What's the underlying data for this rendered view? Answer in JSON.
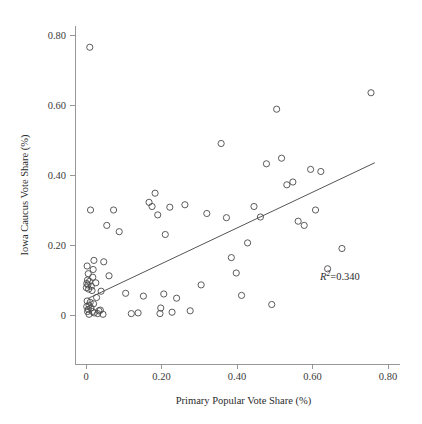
{
  "chart_data": {
    "type": "scatter",
    "title": "",
    "xlabel": "Primary Popular Vote Share (%)",
    "ylabel": "Iowa Caucus Vote Share (%)",
    "xlim": [
      -0.035,
      0.84
    ],
    "ylim": [
      -0.025,
      0.825
    ],
    "grid": false,
    "legend": null,
    "xticks": [
      0,
      0.2,
      0.4,
      0.6,
      0.8
    ],
    "xticklabels": [
      "0",
      "0.20",
      "0.40",
      "0.60",
      "0.80"
    ],
    "yticks": [
      0,
      0.2,
      0.4,
      0.6,
      0.8
    ],
    "yticklabels": [
      "0",
      "0.20",
      "0.40",
      "0.60",
      "0.80"
    ],
    "marker": "open-circle",
    "marker_color": "#4a4a4a",
    "annotations": [
      {
        "name": "r-squared",
        "prefix": "R",
        "superscript": "2",
        "equals": "=",
        "value": "0.340",
        "x": 0.62,
        "y": 0.1
      }
    ],
    "fit_line": {
      "name": "ols-regression-line",
      "x": [
        0.005,
        0.765
      ],
      "y": [
        0.047,
        0.435
      ],
      "slope": 0.51,
      "intercept": 0.0445,
      "color": "#555555"
    },
    "x": [
      0.01,
      0.012,
      0.003,
      0.006,
      0.018,
      0.004,
      0.009,
      0.002,
      0.005,
      0.014,
      0.001,
      0.007,
      0.016,
      0.003,
      0.011,
      0.02,
      0.008,
      0.002,
      0.013,
      0.006,
      0.004,
      0.022,
      0.031,
      0.028,
      0.04,
      0.019,
      0.047,
      0.017,
      0.034,
      0.026,
      0.021,
      0.045,
      0.008,
      0.038,
      0.055,
      0.073,
      0.061,
      0.088,
      0.12,
      0.105,
      0.138,
      0.152,
      0.167,
      0.175,
      0.19,
      0.183,
      0.196,
      0.21,
      0.222,
      0.206,
      0.198,
      0.228,
      0.24,
      0.262,
      0.276,
      0.305,
      0.32,
      0.358,
      0.372,
      0.385,
      0.398,
      0.412,
      0.428,
      0.445,
      0.462,
      0.478,
      0.492,
      0.505,
      0.518,
      0.532,
      0.548,
      0.562,
      0.578,
      0.595,
      0.608,
      0.622,
      0.64,
      0.678,
      0.755
    ],
    "y": [
      0.765,
      0.3,
      0.14,
      0.118,
      0.108,
      0.1,
      0.096,
      0.09,
      0.086,
      0.082,
      0.078,
      0.074,
      0.07,
      0.04,
      0.036,
      0.032,
      0.028,
      0.024,
      0.02,
      0.016,
      0.01,
      0.006,
      0.004,
      0.05,
      0.068,
      0.13,
      0.152,
      0.01,
      0.012,
      0.092,
      0.156,
      0.002,
      0.002,
      0.014,
      0.256,
      0.3,
      0.112,
      0.238,
      0.004,
      0.062,
      0.006,
      0.054,
      0.322,
      0.31,
      0.286,
      0.348,
      0.004,
      0.23,
      0.308,
      0.06,
      0.02,
      0.008,
      0.048,
      0.315,
      0.012,
      0.086,
      0.29,
      0.49,
      0.278,
      0.164,
      0.12,
      0.056,
      0.206,
      0.31,
      0.28,
      0.432,
      0.03,
      0.588,
      0.448,
      0.372,
      0.38,
      0.268,
      0.256,
      0.416,
      0.3,
      0.41,
      0.132,
      0.19,
      0.635
    ]
  }
}
